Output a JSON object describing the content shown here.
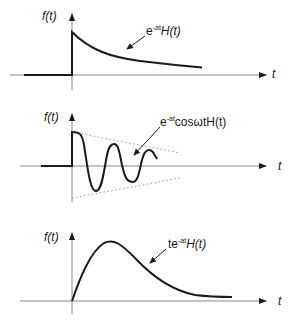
{
  "panels": [
    {
      "id": "decaying-exponential",
      "y_axis_label": "f(t)",
      "x_axis_label": "t",
      "curve_label": {
        "prefix": "e",
        "exponent": "-at",
        "suffix": "H(t)"
      }
    },
    {
      "id": "damped-cosine",
      "y_axis_label": "f(t)",
      "x_axis_label": "t",
      "curve_label": {
        "prefix": "e",
        "exponent": "-at",
        "suffix": "cosωtH(t)"
      }
    },
    {
      "id": "t-times-exponential",
      "y_axis_label": "f(t)",
      "x_axis_label": "t",
      "curve_label": {
        "prefix": "te",
        "exponent": "-at",
        "suffix": "H(t)"
      }
    }
  ],
  "colors": {
    "curve": "#1a1a1a",
    "axis": "#777777",
    "envelope": "#999999"
  }
}
